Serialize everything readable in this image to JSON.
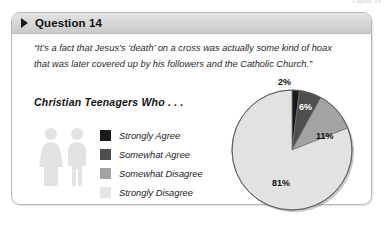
{
  "figure_caption": "Figure 14",
  "card": {
    "header": {
      "bullet_icon": "triangle-right-icon",
      "title": "Question 14"
    },
    "quote": "“It’s a fact that Jesus’s ‘death’ on a cross was actually some kind of hoax that was later covered up by his followers and the Catholic Church.”",
    "subtitle": "Christian Teenagers Who . . .",
    "people_icon": "male-female-pictogram-icon"
  },
  "chart_data": {
    "type": "pie",
    "title": "Christian Teenagers Who . . .",
    "categories": [
      "Strongly Agree",
      "Somewhat Agree",
      "Somewhat Disagree",
      "Strongly Disagree"
    ],
    "values": [
      2,
      6,
      11,
      81
    ],
    "value_labels": [
      "2%",
      "6%",
      "11%",
      "81%"
    ],
    "colors": [
      "#1a1a1a",
      "#4e4e4e",
      "#a3a3a3",
      "#e2e2e2"
    ],
    "legend_position": "left",
    "units": "percent",
    "total": 100
  }
}
